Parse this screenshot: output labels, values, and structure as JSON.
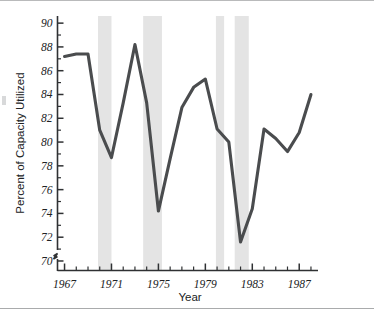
{
  "chart_data": {
    "type": "line",
    "title": "",
    "xlabel": "Year",
    "ylabel": "Percent of Capacity Utilized",
    "xlim": [
      1966.4,
      1988.6
    ],
    "ylim": [
      69.2,
      90.6
    ],
    "grid": false,
    "legend": null,
    "y_axis_break": true,
    "y_ticks_major": [
      70,
      72,
      74,
      76,
      78,
      80,
      82,
      84,
      86,
      88,
      90
    ],
    "y_ticks_minor": [
      71,
      73,
      75,
      77,
      79,
      81,
      83,
      85,
      87,
      89
    ],
    "y_tick_labels": [
      "70",
      "72",
      "74",
      "76",
      "78",
      "80",
      "82",
      "84",
      "86",
      "88",
      "90"
    ],
    "x_ticks_major": [
      1967,
      1971,
      1975,
      1979,
      1983,
      1987
    ],
    "x_tick_labels": [
      "1967",
      "1971",
      "1975",
      "1979",
      "1983",
      "1987"
    ],
    "x_ticks_minor": [
      1968,
      1969,
      1970,
      1972,
      1973,
      1974,
      1976,
      1977,
      1978,
      1980,
      1981,
      1982,
      1984,
      1985,
      1986,
      1988
    ],
    "x": [
      1967,
      1968,
      1969,
      1970,
      1971,
      1972,
      1973,
      1974,
      1975,
      1976,
      1977,
      1978,
      1979,
      1980,
      1981,
      1982,
      1983,
      1984,
      1985,
      1986,
      1987,
      1988
    ],
    "values": [
      87.2,
      87.4,
      87.4,
      81.0,
      78.7,
      83.3,
      88.2,
      83.3,
      74.2,
      78.6,
      82.9,
      84.6,
      85.3,
      81.1,
      80.0,
      71.6,
      74.4,
      81.1,
      80.3,
      79.2,
      80.8,
      84.0
    ],
    "series": [
      {
        "name": "Percent of Capacity Utilized",
        "color": "#4a4c4e",
        "values": [
          87.2,
          87.4,
          87.4,
          81.0,
          78.7,
          83.3,
          88.2,
          83.3,
          74.2,
          78.6,
          82.9,
          84.6,
          85.3,
          81.1,
          80.0,
          71.6,
          74.4,
          81.1,
          80.3,
          79.2,
          80.8,
          84.0
        ]
      }
    ],
    "shaded_bands": [
      {
        "label": "recession-band-1",
        "start": 1969.85,
        "end": 1971.0
      },
      {
        "label": "recession-band-2",
        "start": 1973.7,
        "end": 1975.3
      },
      {
        "label": "recession-band-3",
        "start": 1979.9,
        "end": 1980.6
      },
      {
        "label": "recession-band-4",
        "start": 1981.5,
        "end": 1982.7
      }
    ],
    "band_color": "#e4e4e4",
    "line_color": "#4a4c4e",
    "axis_color": "#2f3133",
    "background_color": "#ffffff"
  }
}
